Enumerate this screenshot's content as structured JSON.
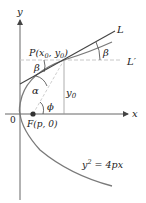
{
  "figure": {
    "axes": {
      "x_label": "x",
      "y_label": "y",
      "origin_label": "0"
    },
    "point_P": {
      "label": "P(x",
      "sub0": "0",
      "mid": ", y",
      "sub1": "0",
      "close": ")"
    },
    "focus": {
      "label": "F(p, 0)"
    },
    "tangent_line": {
      "label": "L"
    },
    "horizontal_line": {
      "label": "L′"
    },
    "height_label": {
      "base": "y",
      "sub": "0"
    },
    "angles": {
      "beta_top": "β",
      "beta_right": "β",
      "alpha": "α",
      "phi": "ϕ"
    },
    "curve_equation": {
      "lhs_base": "y",
      "lhs_exp": "2",
      "rhs": " = 4px"
    },
    "colors": {
      "axis": "#555555",
      "curve": "#777777",
      "tangent": "#444444",
      "dashed": "#bbbbbb",
      "focus_dot": "#333333"
    }
  }
}
